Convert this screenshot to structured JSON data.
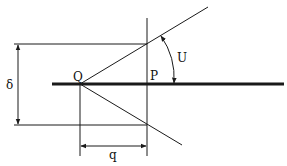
{
  "diagram": {
    "labels": {
      "point_q": "Q",
      "point_p": "P",
      "angle": "U",
      "height_dim": "δ",
      "width_dim": "q"
    },
    "colors": {
      "stroke": "#1a1a1a",
      "background": "#ffffff"
    }
  }
}
